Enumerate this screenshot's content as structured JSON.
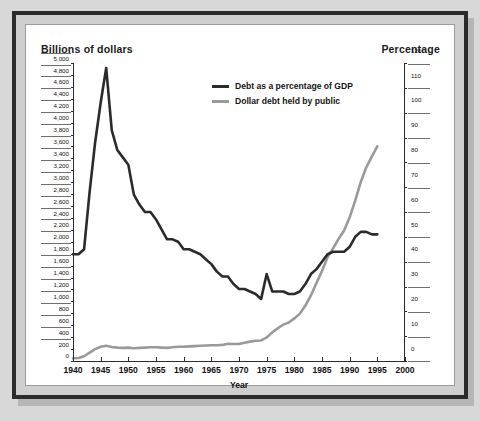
{
  "figure": {
    "left_axis_title": "Billions of dollars",
    "right_axis_title": "Percentage",
    "x_axis_title": "Year"
  },
  "legend": {
    "items": [
      {
        "label": "Debt as a percentage of GDP",
        "color": "#2b2b2b"
      },
      {
        "label": "Dollar debt held by public",
        "color": "#9a9a9a"
      }
    ]
  },
  "colors": {
    "dark_line": "#2b2b2b",
    "gray_line": "#9a9a9a",
    "frame": "#2b2b2b",
    "mat": "#cfcfcf",
    "panel": "#ffffff"
  },
  "chart_data": {
    "type": "line",
    "title": "",
    "xlabel": "Year",
    "ylabel": "Billions of dollars",
    "y2label": "Percentage",
    "xlim": [
      1940,
      2000
    ],
    "ylim": [
      0,
      5000
    ],
    "y2lim": [
      0,
      120
    ],
    "grid": false,
    "legend_position": "upper-center",
    "xticks": [
      1940,
      1945,
      1950,
      1955,
      1960,
      1965,
      1970,
      1975,
      1980,
      1985,
      1990,
      1995,
      2000
    ],
    "xticklabels": [
      "1940",
      "1945",
      "1950",
      "1955",
      "1960",
      "1965",
      "1970",
      "1975",
      "1980",
      "1985",
      "1990",
      "1995",
      "2000"
    ],
    "yticks": [
      0,
      200,
      400,
      600,
      800,
      1000,
      1200,
      1400,
      1600,
      1800,
      2000,
      2200,
      2400,
      2600,
      2800,
      3000,
      3200,
      3400,
      3600,
      3800,
      4000,
      4200,
      4400,
      4600,
      4800,
      5000
    ],
    "yticklabels": [
      "0",
      "200",
      "400",
      "600",
      "800",
      "1,000",
      "1,200",
      "1,400",
      "1,600",
      "1,800",
      "2,000",
      "2,200",
      "2,400",
      "2,600",
      "2,800",
      "3,000",
      "3,200",
      "3,400",
      "3,600",
      "3,800",
      "4,000",
      "4,200",
      "4,400",
      "4,600",
      "4,800",
      "5,000"
    ],
    "y2ticks": [
      0,
      10,
      20,
      30,
      40,
      50,
      60,
      70,
      80,
      90,
      100,
      110,
      120
    ],
    "y2ticklabels": [
      "0",
      "10",
      "20",
      "30",
      "40",
      "50",
      "60",
      "70",
      "80",
      "90",
      "100",
      "110",
      "120"
    ],
    "series": [
      {
        "name": "Debt as a percentage of GDP",
        "axis": "right",
        "units": "percent of GDP",
        "color": "#2b2b2b",
        "x": [
          1940,
          1941,
          1942,
          1943,
          1944,
          1945,
          1946,
          1947,
          1948,
          1949,
          1950,
          1951,
          1952,
          1953,
          1954,
          1955,
          1956,
          1957,
          1958,
          1959,
          1960,
          1961,
          1962,
          1963,
          1964,
          1965,
          1966,
          1967,
          1968,
          1969,
          1970,
          1971,
          1972,
          1973,
          1974,
          1975,
          1976,
          1977,
          1978,
          1979,
          1980,
          1981,
          1982,
          1983,
          1984,
          1985,
          1986,
          1987,
          1988,
          1989,
          1990,
          1991,
          1992,
          1993,
          1994,
          1995
        ],
        "values": [
          43,
          43,
          45,
          68,
          88,
          104,
          118,
          93,
          85,
          82,
          79,
          67,
          63,
          60,
          60,
          57,
          53,
          49,
          49,
          48,
          45,
          45,
          44,
          43,
          41,
          39,
          36,
          34,
          34,
          31,
          29,
          29,
          28,
          27,
          25,
          35,
          28,
          28,
          28,
          27,
          27,
          28,
          31,
          35,
          37,
          40,
          43,
          44,
          44,
          44,
          46,
          50,
          52,
          52,
          51,
          51
        ]
      },
      {
        "name": "Dollar debt held by public",
        "axis": "left",
        "units": "billions of dollars",
        "color": "#9a9a9a",
        "x": [
          1940,
          1941,
          1942,
          1943,
          1944,
          1945,
          1946,
          1947,
          1948,
          1949,
          1950,
          1951,
          1952,
          1953,
          1954,
          1955,
          1956,
          1957,
          1958,
          1959,
          1960,
          1961,
          1962,
          1963,
          1964,
          1965,
          1966,
          1967,
          1968,
          1969,
          1970,
          1971,
          1972,
          1973,
          1974,
          1975,
          1976,
          1977,
          1978,
          1979,
          1980,
          1981,
          1982,
          1983,
          1984,
          1985,
          1986,
          1987,
          1988,
          1989,
          1990,
          1991,
          1992,
          1993,
          1994,
          1995
        ],
        "values": [
          45,
          50,
          80,
          140,
          200,
          240,
          255,
          235,
          225,
          220,
          225,
          215,
          220,
          225,
          230,
          230,
          225,
          220,
          230,
          240,
          240,
          245,
          250,
          255,
          260,
          265,
          265,
          270,
          290,
          285,
          285,
          305,
          325,
          340,
          345,
          395,
          480,
          550,
          610,
          645,
          715,
          795,
          930,
          1100,
          1310,
          1510,
          1740,
          1890,
          2050,
          2190,
          2410,
          2690,
          3000,
          3250,
          3430,
          3600
        ]
      }
    ]
  }
}
